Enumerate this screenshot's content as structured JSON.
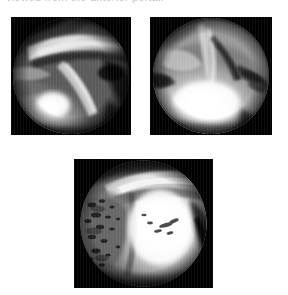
{
  "figure": {
    "background_color": "#ffffff",
    "width": 288,
    "height": 295,
    "caption_partial": "viewed from the anterior portal.",
    "panel_count": 3,
    "modality": "arthroscopy"
  },
  "panels": [
    {
      "id": "panel-a",
      "position": "top-left",
      "x": 11,
      "y": 17,
      "width": 120,
      "height": 118,
      "frame_color": "#000000",
      "field_shape": "circular",
      "field_center_x": 0.5,
      "field_center_y": 0.5,
      "field_radius": 0.495,
      "tone": "dark-gray",
      "description": "Arthroscopic view of joint showing fibrous bands and bright illuminated soft tissue in the lower left quadrant",
      "highlight_x": 0.35,
      "highlight_y": 0.74,
      "palette": {
        "shadow": "#0a0a0a",
        "mid": "#6e6e6e",
        "bright": "#d8d8d8",
        "specular": "#ffffff"
      }
    },
    {
      "id": "panel-b",
      "position": "top-right",
      "x": 150,
      "y": 17,
      "width": 122,
      "height": 118,
      "frame_color": "#000000",
      "field_shape": "circular",
      "field_center_x": 0.5,
      "field_center_y": 0.5,
      "field_radius": 0.495,
      "tone": "light-gray",
      "description": "Arthroscopic view with bright central illumination and dark linear clefts in the upper right",
      "highlight_x": 0.46,
      "highlight_y": 0.68,
      "palette": {
        "shadow": "#141414",
        "mid": "#8d8d8d",
        "bright": "#e6e6e6",
        "specular": "#ffffff"
      }
    },
    {
      "id": "panel-c",
      "position": "bottom-center",
      "x": 74,
      "y": 159,
      "width": 139,
      "height": 129,
      "frame_color": "#000000",
      "field_shape": "circular",
      "field_center_x": 0.5,
      "field_center_y": 0.5,
      "field_radius": 0.495,
      "tone": "high-contrast",
      "description": "Arthroscopic view showing roughened fibrillated cartilage surface with speckled debris on the left and a bright smooth surface on the right",
      "highlight_x": 0.6,
      "highlight_y": 0.52,
      "palette": {
        "shadow": "#101010",
        "mid": "#9a9a9a",
        "bright": "#f2f2f2",
        "specular": "#ffffff"
      }
    }
  ]
}
